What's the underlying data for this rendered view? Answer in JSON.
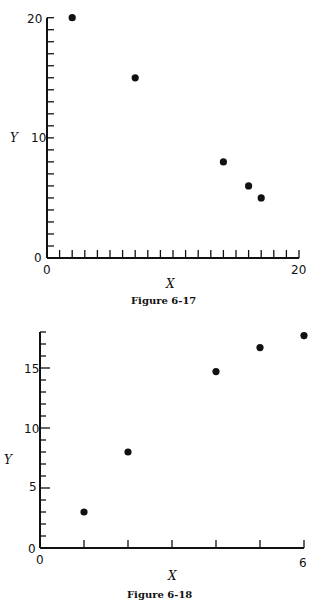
{
  "chart_data": [
    {
      "type": "scatter",
      "title": "Figure 6-17",
      "xlabel": "X",
      "ylabel": "Y",
      "xlim": [
        0,
        20
      ],
      "ylim": [
        0,
        20
      ],
      "x_tick_labels": [
        "0",
        "20"
      ],
      "y_tick_labels": [
        "0",
        "10",
        "20"
      ],
      "x_minor_tick_step": 1,
      "y_minor_tick_step": 1,
      "grid": false,
      "legend": null,
      "x": [
        2,
        7,
        14,
        16,
        17
      ],
      "y": [
        20,
        15,
        8,
        6,
        5
      ]
    },
    {
      "type": "scatter",
      "title": "Figure 6-18",
      "xlabel": "X",
      "ylabel": "Y",
      "xlim": [
        0,
        6
      ],
      "ylim": [
        0,
        18
      ],
      "x_tick_labels": [
        "0",
        "6"
      ],
      "y_tick_labels": [
        "0",
        "5",
        "10",
        "15"
      ],
      "x_minor_tick_step": 1,
      "y_minor_tick_step": 1,
      "grid": false,
      "legend": null,
      "x": [
        1,
        2,
        4,
        5,
        6
      ],
      "y": [
        3,
        8,
        14.7,
        16.7,
        17.7
      ]
    }
  ],
  "figures": [
    {
      "caption": "Figure 6-17",
      "xlabel": "X",
      "ylabel": "Y",
      "x_origin_label": "0",
      "x_end_label": "20",
      "y_labels": [
        "0",
        "10",
        "20"
      ]
    },
    {
      "caption": "Figure 6-18",
      "xlabel": "X",
      "ylabel": "Y",
      "x_origin_label": "0",
      "x_end_label": "6",
      "y_labels": [
        "0",
        "5",
        "10",
        "15"
      ]
    }
  ],
  "colors": {
    "ink": "#111111",
    "background": "#ffffff"
  }
}
